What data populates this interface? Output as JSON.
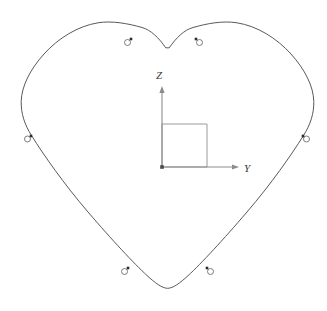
{
  "figure": {
    "title": "",
    "background_color": "#ffffff",
    "curve_color": "#595959",
    "axis_color": "#8c8c8c",
    "marker_ring_color": "#6e6e6e",
    "marker_dot_color": "#2b2b2b",
    "axes": {
      "vertical": {
        "label": "Z",
        "label_x": 159,
        "label_y": 79,
        "from": [
          162,
          167
        ],
        "to": [
          162,
          86
        ],
        "arrow": "up"
      },
      "horizontal": {
        "label": "Y",
        "label_x": 244,
        "label_y": 172,
        "from": [
          162,
          167
        ],
        "to": [
          239,
          167
        ],
        "arrow": "right"
      },
      "origin": [
        162,
        167
      ],
      "origin_marker": "filled-square-dot"
    },
    "reference_square": {
      "name": "unit-cell-square",
      "x": 162,
      "y": 124,
      "width": 45,
      "height": 43
    },
    "outline": {
      "name": "heart-cross-section-curve",
      "path": "M 165.5 47.5 C 159 38 151 30 142 27.5 C 128 23.5 112 20.5 98 22.8 C 78 26 58.5 38 44 54 C 30 69.5 21.5 86.5 21.2 101.5 C 21.0 113.5 24.5 124.5 31.5 135.5 C 44 155.5 64 184 88 212 C 112 240 134 263.5 147 275.5 C 155 282.8 162 288.2 167.5 288.3 C 173 288.4 180 283 188 275.7 C 201 263.7 223 240 247 212 C 271 184 291 155.5 303.5 135.5 C 310.5 124.5 314 113.5 313.8 101.5 C 313.5 86.5 305 69.5 291 54 C 276.5 38 257 26 237 22.8 C 223 20.5 207 23.5 193 27.5 C 184 30 176 38 169.5 47.5 Z",
      "closed": true,
      "stroke_width": 1
    },
    "markers": [
      {
        "name": "node-top-left",
        "dot": [
          131,
          39
        ],
        "ring": [
          127.5,
          42.5
        ]
      },
      {
        "name": "node-top-right",
        "dot": [
          196,
          39
        ],
        "ring": [
          199.5,
          42.5
        ]
      },
      {
        "name": "node-left-mid",
        "dot": [
          31,
          136
        ],
        "ring": [
          27.5,
          139.0
        ]
      },
      {
        "name": "node-bottom-left",
        "dot": [
          128,
          268
        ],
        "ring": [
          124.5,
          271.5
        ]
      },
      {
        "name": "node-bottom-right",
        "dot": [
          207,
          268
        ],
        "ring": [
          210.5,
          271.5
        ]
      },
      {
        "name": "node-right-mid",
        "dot": [
          303,
          136
        ],
        "ring": [
          306.5,
          139.0
        ]
      }
    ],
    "marker_dot_size": 2.6,
    "marker_ring_radius": 3.0
  },
  "chart_data": {
    "type": "line",
    "title": "",
    "xlabel": "Y",
    "ylabel": "Z",
    "grid": false,
    "legend": null,
    "annotations": [
      {
        "text": "Z",
        "role": "vertical-axis-label"
      },
      {
        "text": "Y",
        "role": "horizontal-axis-label"
      }
    ],
    "series": [
      {
        "name": "heart-cross-section-outline",
        "closed": true,
        "description": "Closed heart-shaped outline curve drawn in the Y-Z plane, with quarter-symmetry reference square at the origin.",
        "points_yz": [
          [
            0.0,
            1.78
          ],
          [
            -0.35,
            1.92
          ],
          [
            -1.0,
            2.02
          ],
          [
            -1.62,
            1.92
          ],
          [
            -2.15,
            1.58
          ],
          [
            -2.62,
            1.06
          ],
          [
            -2.93,
            0.47
          ],
          [
            -3.05,
            -0.05
          ],
          [
            -2.96,
            -0.62
          ],
          [
            -2.62,
            -1.22
          ],
          [
            -2.08,
            -1.95
          ],
          [
            -1.42,
            -2.68
          ],
          [
            -0.78,
            -3.3
          ],
          [
            -0.2,
            -3.7
          ],
          [
            0.06,
            -3.75
          ],
          [
            0.45,
            -3.62
          ],
          [
            1.05,
            -3.18
          ],
          [
            1.72,
            -2.52
          ],
          [
            2.32,
            -1.8
          ],
          [
            2.82,
            -1.08
          ],
          [
            3.05,
            -0.42
          ],
          [
            3.05,
            0.18
          ],
          [
            2.8,
            0.88
          ],
          [
            2.35,
            1.48
          ],
          [
            1.8,
            1.88
          ],
          [
            1.18,
            2.02
          ],
          [
            0.6,
            1.95
          ],
          [
            0.16,
            1.82
          ],
          [
            0.0,
            1.78
          ]
        ]
      }
    ],
    "markers": [
      {
        "label": "node-top-left",
        "y": -0.88,
        "z": 1.66
      },
      {
        "label": "node-top-right",
        "y": 0.91,
        "z": 1.66
      },
      {
        "label": "node-left-mid",
        "y": -2.88,
        "z": -0.78
      },
      {
        "label": "node-bottom-left",
        "y": -0.95,
        "z": -3.45
      },
      {
        "label": "node-bottom-right",
        "y": 1.23,
        "z": -3.45
      },
      {
        "label": "node-right-mid",
        "y": 3.0,
        "z": -0.78
      }
    ],
    "reference_square_yz": {
      "y0": 0.0,
      "z0": 0.0,
      "y1": 1.22,
      "z1": 1.18
    },
    "ylim": [
      -3.4,
      4.5
    ],
    "zlim": [
      -4.0,
      2.3
    ]
  }
}
